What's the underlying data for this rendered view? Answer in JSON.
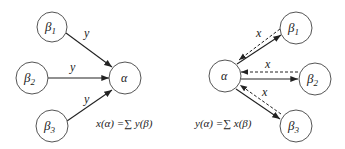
{
  "left_panel": {
    "nodes": {
      "beta1": {
        "base": "β",
        "sub": "1"
      },
      "beta2": {
        "base": "β",
        "sub": "2"
      },
      "beta3": {
        "base": "β",
        "sub": "3"
      },
      "alpha": {
        "label": "α"
      }
    },
    "edge_labels": [
      "y",
      "y",
      "y"
    ],
    "formula": "x(α) =∑ y(β)"
  },
  "right_panel": {
    "nodes": {
      "alpha": {
        "label": "α"
      },
      "beta1": {
        "base": "β",
        "sub": "1"
      },
      "beta2": {
        "base": "β",
        "sub": "2"
      },
      "beta3": {
        "base": "β",
        "sub": "3"
      }
    },
    "edge_labels": [
      "x",
      "x",
      "x"
    ],
    "formula": "y(α) =∑ x(β)"
  }
}
